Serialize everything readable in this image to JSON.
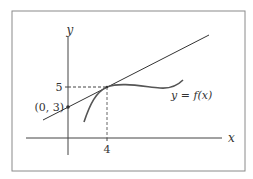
{
  "diagram": {
    "type": "tangent-line-diagram",
    "axes": {
      "x_label": "x",
      "y_label": "y"
    },
    "curve_label": "y = f(x)",
    "tick_x_label": "4",
    "tick_y_label": "5",
    "intercept_label": "(0, 3)",
    "tangent_point": {
      "x": 4,
      "y": 5
    },
    "y_intercept": {
      "x": 0,
      "y": 3
    },
    "colors": {
      "line": "#333333",
      "curve": "#555555",
      "frame": "#8a8a8a",
      "dashed": "#444444"
    }
  }
}
